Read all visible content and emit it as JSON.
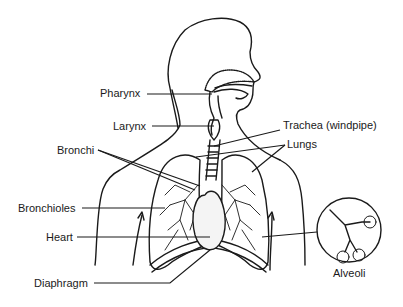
{
  "diagram": {
    "labels": {
      "pharynx": "Pharynx",
      "larynx": "Larynx",
      "trachea": "Trachea (windpipe)",
      "lungs": "Lungs",
      "bronchi": "Bronchi",
      "bronchioles": "Bronchioles",
      "heart": "Heart",
      "diaphragm": "Diaphragm",
      "alveoli": "Alveoli"
    },
    "colors": {
      "line": "#1a1a1a",
      "background": "#ffffff"
    }
  }
}
